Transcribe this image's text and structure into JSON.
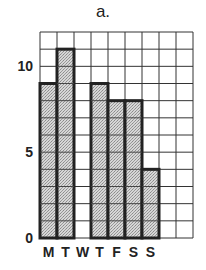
{
  "chart_data": {
    "type": "bar",
    "title": "a.",
    "categories": [
      "M",
      "T",
      "W",
      "T",
      "F",
      "S",
      "S"
    ],
    "values": [
      9,
      11,
      0,
      9,
      8,
      8,
      4
    ],
    "xlabel": "",
    "ylabel": "",
    "ylim": [
      0,
      12
    ],
    "yticks": [
      0,
      5,
      10
    ],
    "grid": true,
    "grid_columns": 9,
    "grid_rows": 12,
    "bar_fill": "#c8c8c8",
    "bar_outline": "#222222"
  }
}
